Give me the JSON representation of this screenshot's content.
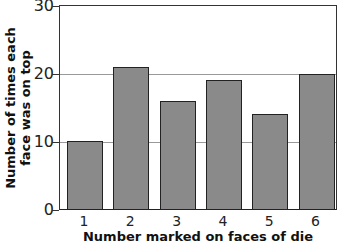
{
  "chart_data": {
    "type": "bar",
    "title": "",
    "categories": [
      "1",
      "2",
      "3",
      "4",
      "5",
      "6"
    ],
    "values": [
      10,
      21,
      16,
      19,
      14,
      20
    ],
    "xlabel": "Number marked on faces of die",
    "ylabel": [
      "Number of times each",
      "face was on top"
    ],
    "ylim": [
      0,
      30
    ],
    "yticks": [
      "0",
      "10",
      "20",
      "30"
    ],
    "grid": {
      "horizontal": [
        10,
        20
      ]
    },
    "legend": null,
    "colors": {
      "bar_fill": "#8a8a8a",
      "bar_border": "#222222",
      "gridline": "#999999"
    }
  }
}
